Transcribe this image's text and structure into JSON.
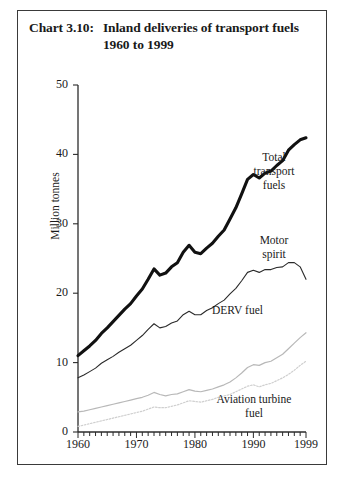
{
  "title": {
    "number": "Chart 3.10:",
    "text": "Inland deliveries of transport fuels 1960 to 1999"
  },
  "axes": {
    "ylabel": "Million tonnes",
    "xlabel": "",
    "yticks": [
      "0",
      "10",
      "20",
      "30",
      "40",
      "50"
    ],
    "xticks": [
      "1960",
      "1970",
      "1980",
      "1990",
      "1999"
    ]
  },
  "series_labels": {
    "total": "Total\ntransport\nfuels",
    "motor_spirit": "Motor\nspirit",
    "derv": "DERV fuel",
    "aviation": "Aviation turbine\nfuel"
  },
  "colors": {
    "total": "#111111",
    "motor_spirit": "#2a2a2a",
    "derv": "#b8b8b8",
    "aviation": "#cfcfcf",
    "axis": "#2b2b2b",
    "frame": "#3a3a3a"
  },
  "chart_data": {
    "type": "line",
    "title": "Chart 3.10: Inland deliveries of transport fuels 1960 to 1999",
    "xlabel": "",
    "ylabel": "Million tonnes",
    "xlim": [
      1960,
      1999
    ],
    "ylim": [
      0,
      50
    ],
    "grid": false,
    "legend": "inline-annotations",
    "xticks": [
      1960,
      1970,
      1980,
      1990,
      1999
    ],
    "yticks": [
      0,
      10,
      20,
      30,
      40,
      50
    ],
    "minor_xticks": "every year 1960-1999",
    "x": [
      1960,
      1961,
      1962,
      1963,
      1964,
      1965,
      1966,
      1967,
      1968,
      1969,
      1970,
      1971,
      1972,
      1973,
      1974,
      1975,
      1976,
      1977,
      1978,
      1979,
      1980,
      1981,
      1982,
      1983,
      1984,
      1985,
      1986,
      1987,
      1988,
      1989,
      1990,
      1991,
      1992,
      1993,
      1994,
      1995,
      1996,
      1997,
      1998,
      1999
    ],
    "series": [
      {
        "name": "Total transport fuels",
        "style": "thick-solid-black",
        "values": [
          11.0,
          11.7,
          12.4,
          13.2,
          14.2,
          15.0,
          15.9,
          16.8,
          17.7,
          18.5,
          19.6,
          20.6,
          22.0,
          23.5,
          22.6,
          22.9,
          23.8,
          24.4,
          25.9,
          26.9,
          25.9,
          25.7,
          26.5,
          27.2,
          28.2,
          29.1,
          30.7,
          32.3,
          34.3,
          36.4,
          37.1,
          36.6,
          37.3,
          37.6,
          38.4,
          39.1,
          40.6,
          41.4,
          42.1,
          42.4
        ]
      },
      {
        "name": "Motor spirit",
        "style": "thin-solid-dark",
        "values": [
          7.8,
          8.2,
          8.7,
          9.2,
          9.9,
          10.4,
          10.9,
          11.5,
          12.0,
          12.5,
          13.2,
          13.9,
          14.8,
          15.6,
          15.0,
          15.2,
          15.7,
          16.0,
          16.9,
          17.4,
          16.9,
          16.9,
          17.5,
          17.9,
          18.5,
          19.0,
          19.9,
          20.7,
          21.8,
          23.0,
          23.3,
          23.0,
          23.4,
          23.4,
          23.7,
          23.8,
          24.4,
          24.4,
          23.8,
          22.0
        ]
      },
      {
        "name": "DERV fuel",
        "style": "light-grey-solid",
        "values": [
          2.9,
          3.0,
          3.2,
          3.4,
          3.6,
          3.8,
          4.0,
          4.2,
          4.4,
          4.6,
          4.8,
          5.0,
          5.3,
          5.7,
          5.4,
          5.2,
          5.4,
          5.5,
          5.8,
          6.1,
          5.9,
          5.8,
          6.0,
          6.2,
          6.5,
          6.8,
          7.2,
          7.8,
          8.5,
          9.3,
          9.7,
          9.6,
          10.0,
          10.2,
          10.7,
          11.2,
          12.0,
          12.8,
          13.6,
          14.3
        ]
      },
      {
        "name": "Aviation turbine fuel",
        "style": "light-grey-dotted",
        "values": [
          0.8,
          1.0,
          1.2,
          1.4,
          1.6,
          1.8,
          2.0,
          2.2,
          2.4,
          2.6,
          2.8,
          3.0,
          3.3,
          3.6,
          3.5,
          3.5,
          3.7,
          3.9,
          4.2,
          4.5,
          4.4,
          4.3,
          4.5,
          4.7,
          5.0,
          5.2,
          5.4,
          5.8,
          6.2,
          6.6,
          6.8,
          6.5,
          6.8,
          7.0,
          7.4,
          7.8,
          8.3,
          8.9,
          9.6,
          10.2
        ]
      }
    ]
  }
}
